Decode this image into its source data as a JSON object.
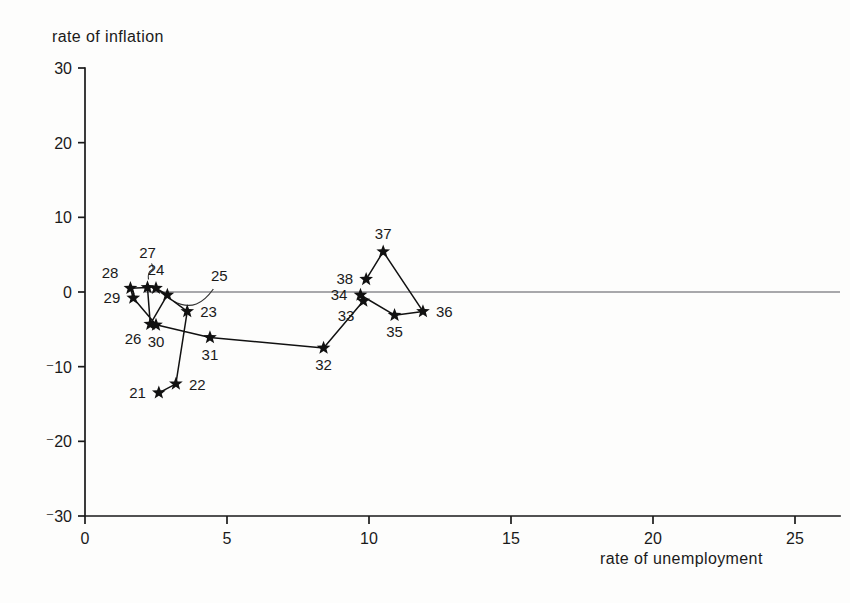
{
  "chart_data": {
    "type": "scatter",
    "title": "",
    "ylabel": "rate of inflation",
    "xlabel": "rate of  unemployment",
    "xlim": [
      0,
      25
    ],
    "ylim": [
      -30,
      30
    ],
    "xticks": [
      0,
      5,
      10,
      15,
      20,
      25
    ],
    "xticklabels": [
      "0",
      "5",
      "10",
      "15",
      "20",
      "25"
    ],
    "yticks": [
      30,
      20,
      10,
      0,
      -10,
      -20,
      -30
    ],
    "yticklabels": [
      "30",
      "20",
      "10",
      "0",
      "⁻10",
      "⁻20",
      "⁻30"
    ],
    "grid": false,
    "legend": null,
    "connected": true,
    "marker": "star",
    "zero_reference_line": 0,
    "series": [
      {
        "name": "inflation vs unemployment",
        "points": [
          {
            "label": "21",
            "x": 2.6,
            "y": -13.5,
            "label_pos": "left"
          },
          {
            "label": "22",
            "x": 3.2,
            "y": -12.3,
            "label_pos": "right"
          },
          {
            "label": "23",
            "x": 3.6,
            "y": -2.6,
            "label_pos": "right"
          },
          {
            "label": "24",
            "x": 2.5,
            "y": 0.5,
            "label_pos": "above"
          },
          {
            "label": "25",
            "x": 2.9,
            "y": -0.4,
            "label_pos": "leader-right"
          },
          {
            "label": "26",
            "x": 2.3,
            "y": -4.3,
            "label_pos": "below-left"
          },
          {
            "label": "27",
            "x": 2.2,
            "y": 0.6,
            "label_pos": "leader-above"
          },
          {
            "label": "28",
            "x": 1.6,
            "y": 0.5,
            "label_pos": "above-left"
          },
          {
            "label": "29",
            "x": 1.7,
            "y": -0.8,
            "label_pos": "left"
          },
          {
            "label": "30",
            "x": 2.5,
            "y": -4.4,
            "label_pos": "below"
          },
          {
            "label": "31",
            "x": 4.4,
            "y": -6.1,
            "label_pos": "below"
          },
          {
            "label": "32",
            "x": 8.4,
            "y": -7.5,
            "label_pos": "below"
          },
          {
            "label": "33",
            "x": 9.8,
            "y": -1.2,
            "label_pos": "below-left"
          },
          {
            "label": "34",
            "x": 9.7,
            "y": -0.4,
            "label_pos": "left"
          },
          {
            "label": "35",
            "x": 10.9,
            "y": -3.1,
            "label_pos": "below"
          },
          {
            "label": "36",
            "x": 11.9,
            "y": -2.6,
            "label_pos": "right"
          },
          {
            "label": "37",
            "x": 10.5,
            "y": 5.4,
            "label_pos": "above"
          },
          {
            "label": "38",
            "x": 9.9,
            "y": 1.7,
            "label_pos": "left"
          }
        ]
      }
    ]
  },
  "colors": {
    "ink": "#1a1a1a",
    "marker": "#111111",
    "zero_line": "#55555a",
    "background": "#fdfdfc"
  }
}
